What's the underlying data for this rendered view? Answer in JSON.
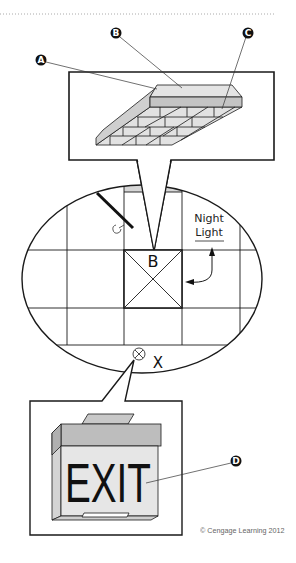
{
  "diagram": {
    "callout_labels": {
      "a": "A",
      "b": "B",
      "c": "C",
      "d": "D"
    },
    "plan": {
      "fixture_tag": "B",
      "night_light_line1": "Night",
      "night_light_line2": "Light",
      "exit_tag": "X"
    },
    "exit_sign": {
      "text": "EXIT"
    },
    "colors": {
      "line": "#1a1a1a",
      "fixture_gray_light": "#e2e2e2",
      "fixture_gray_mid": "#c4c4c4",
      "exit_face": "#e6e6e6",
      "exit_band": "#bdbdbd"
    }
  },
  "footer": {
    "copyright": "© Cengage Learning 2012"
  }
}
